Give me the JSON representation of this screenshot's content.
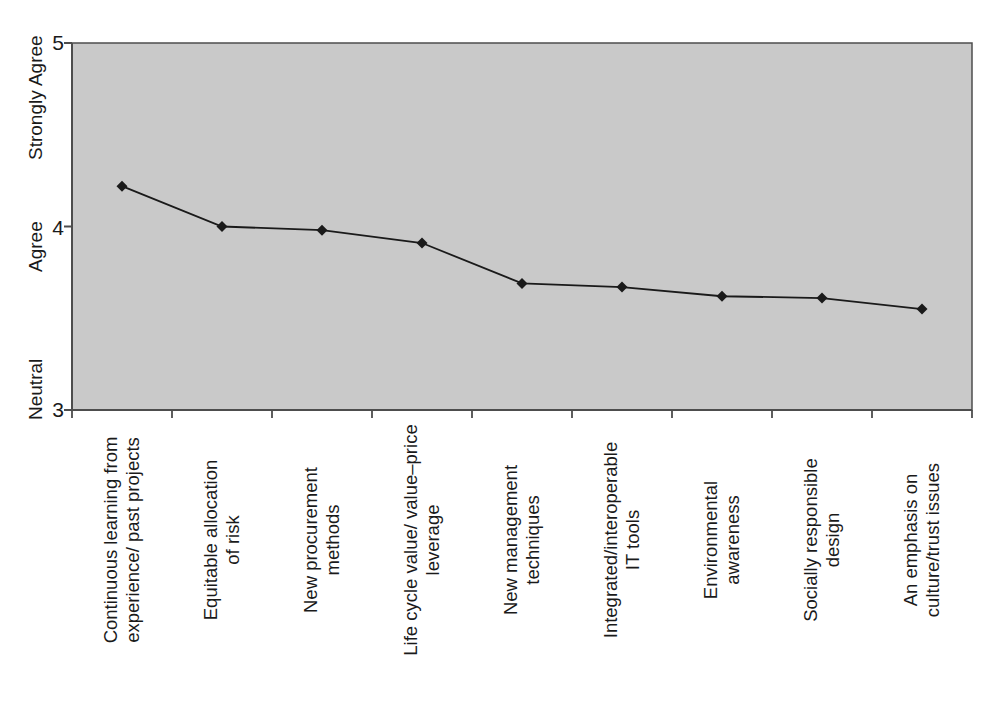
{
  "chart_data": {
    "type": "line",
    "title": "",
    "xlabel": "",
    "ylabel": "",
    "ylim": [
      3,
      5
    ],
    "grid": false,
    "legend": "none",
    "marker": "diamond",
    "categories": [
      "Continuous learning from experience/ past projects",
      "Equitable allocation of risk",
      "New procurement methods",
      "Life cycle value/ value–price leverage",
      "New management techniques",
      "Integrated/interoperable IT tools",
      "Environmental awareness",
      "Socially responsible design",
      "An emphasis on culture/trust issues"
    ],
    "category_lines": [
      [
        "Continuous learning from",
        "experience/ past projects"
      ],
      [
        "Equitable allocation",
        "of risk"
      ],
      [
        "New procurement",
        "methods"
      ],
      [
        "Life cycle value/ value–price",
        "leverage"
      ],
      [
        "New management",
        "techniques"
      ],
      [
        "Integrated/interoperable",
        "IT tools"
      ],
      [
        "Environmental",
        "awareness"
      ],
      [
        "Socially responsible",
        "design"
      ],
      [
        "An emphasis on",
        "culture/trust issues"
      ]
    ],
    "values": [
      4.22,
      4.0,
      3.98,
      3.91,
      3.69,
      3.67,
      3.62,
      3.61,
      3.55
    ],
    "ytick_values": [
      5,
      4,
      3
    ],
    "ytick_labels": [
      "5",
      "4",
      "3"
    ],
    "ytick_named": [
      {
        "value": 5,
        "name": "Strongly Agree"
      },
      {
        "value": 4,
        "name": "Agree"
      },
      {
        "value": 3,
        "name": "Neutral"
      }
    ],
    "colors": {
      "plot_background": "#c9c9c9",
      "axis": "#4d4d4d",
      "line": "#1a1a1a",
      "marker": "#1a1a1a",
      "text": "#1a1a1a",
      "page_background": "#ffffff"
    }
  }
}
